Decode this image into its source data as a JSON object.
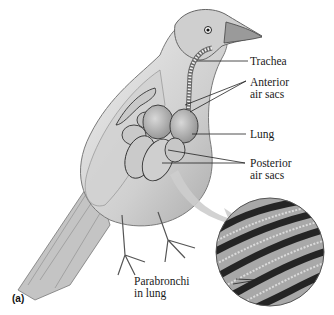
{
  "figure": {
    "panel_label": "(a)",
    "labels": {
      "trachea": "Trachea",
      "anterior_line1": "Anterior",
      "anterior_line2": "air sacs",
      "lung": "Lung",
      "posterior_line1": "Posterior",
      "posterior_line2": "air sacs",
      "parabronchi_line1": "Parabronchi",
      "parabronchi_line2": "in lung"
    },
    "colors": {
      "ink": "#1a1a1a",
      "bird_fill": "#d9d9d9",
      "organ_fill": "#bdbdbd",
      "arrow": "#c8c8c8",
      "micrograph_dark": "#222222"
    }
  }
}
